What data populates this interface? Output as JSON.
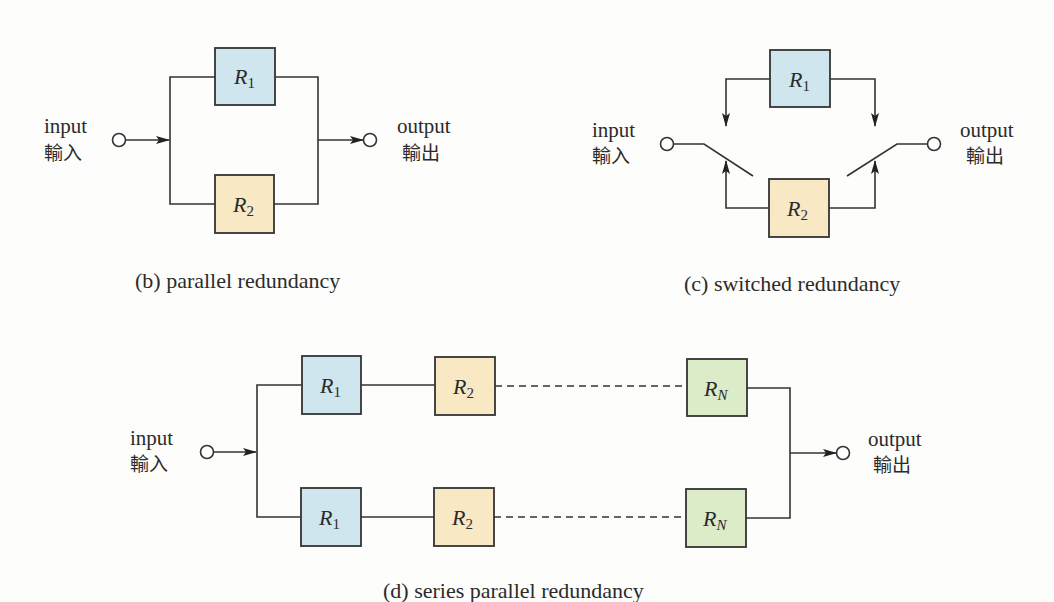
{
  "colors": {
    "r1_fill": "#cfe6ef",
    "r2_fill": "#f8e8c4",
    "rn_fill": "#dcebc8"
  },
  "diagram_b": {
    "caption": "(b) parallel redundancy",
    "input_label": "input",
    "input_label_cjk": "輸入",
    "output_label": "output",
    "output_label_cjk": "輸出",
    "blocks": [
      {
        "main": "R",
        "sub": "1",
        "fill_key": "r1_fill"
      },
      {
        "main": "R",
        "sub": "2",
        "fill_key": "r2_fill"
      }
    ]
  },
  "diagram_c": {
    "caption": "(c) switched redundancy",
    "input_label": "input",
    "input_label_cjk": "輸入",
    "output_label": "output",
    "output_label_cjk": "輸出",
    "blocks": [
      {
        "main": "R",
        "sub": "1",
        "fill_key": "r1_fill"
      },
      {
        "main": "R",
        "sub": "2",
        "fill_key": "r2_fill"
      }
    ]
  },
  "diagram_d": {
    "caption": "(d) series parallel redundancy",
    "input_label": "input",
    "input_label_cjk": "輸入",
    "output_label": "output",
    "output_label_cjk": "輸出",
    "rows": [
      [
        {
          "main": "R",
          "sub": "1",
          "fill_key": "r1_fill"
        },
        {
          "main": "R",
          "sub": "2",
          "fill_key": "r2_fill"
        },
        {
          "main": "R",
          "sub": "N",
          "fill_key": "rn_fill"
        }
      ],
      [
        {
          "main": "R",
          "sub": "1",
          "fill_key": "r1_fill"
        },
        {
          "main": "R",
          "sub": "2",
          "fill_key": "r2_fill"
        },
        {
          "main": "R",
          "sub": "N",
          "fill_key": "rn_fill"
        }
      ]
    ]
  }
}
